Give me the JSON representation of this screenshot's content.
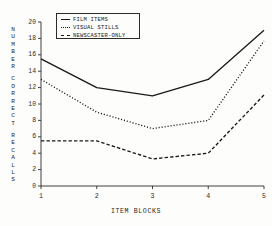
{
  "chart_data": {
    "type": "line",
    "title": "",
    "xlabel": "ITEM  BLOCKS",
    "ylabel": "NUMBER CORRECT RECALLS",
    "ylabel_words": [
      "NUMBER",
      "CORRECT",
      "RECALLS"
    ],
    "categories": [
      "1",
      "2",
      "3",
      "4",
      "5"
    ],
    "x": [
      1,
      2,
      3,
      4,
      5
    ],
    "xlim": [
      1,
      5
    ],
    "ylim": [
      0,
      20
    ],
    "yticks": [
      0,
      2,
      4,
      6,
      8,
      10,
      12,
      14,
      16,
      18,
      20
    ],
    "xticks": [
      1,
      2,
      3,
      4,
      5
    ],
    "grid": false,
    "legend_position": "top-left-inside",
    "series": [
      {
        "name": "FILM ITEMS",
        "style": "solid",
        "color": "#1a1a1a",
        "values": [
          15.5,
          12.0,
          11.0,
          13.0,
          19.0
        ]
      },
      {
        "name": "VISUAL STILLS",
        "style": "dotted",
        "color": "#1a1a1a",
        "values": [
          13.0,
          9.0,
          7.0,
          8.0,
          17.7
        ]
      },
      {
        "name": "NEWSCASTER-ONLY",
        "style": "dashed",
        "color": "#1a1a1a",
        "values": [
          5.5,
          5.5,
          3.3,
          4.0,
          11.1
        ]
      }
    ]
  },
  "axis": {
    "y_tick_labels": [
      "20",
      "18",
      "16",
      "14",
      "12",
      "10",
      "8",
      "6",
      "4",
      "2",
      "0"
    ],
    "x_tick_labels": [
      "1",
      "2",
      "3",
      "4",
      "5"
    ],
    "x_title": "ITEM  BLOCKS"
  },
  "legend": {
    "items": [
      {
        "label": "FILM ITEMS",
        "key": "solid-line-key"
      },
      {
        "label": "VISUAL STILLS",
        "key": "dotted-line-key"
      },
      {
        "label": "NEWSCASTER-ONLY",
        "key": "dashed-line-key"
      }
    ]
  },
  "ylabel_letters": [
    "N",
    "U",
    "M",
    "B",
    "E",
    "R",
    "C",
    "O",
    "R",
    "R",
    "E",
    "C",
    "T",
    "R",
    "E",
    "C",
    "A",
    "L",
    "L",
    "S"
  ]
}
